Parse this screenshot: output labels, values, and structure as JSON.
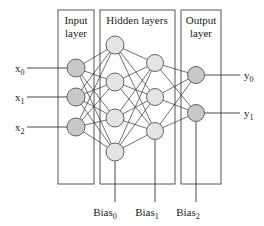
{
  "diagram": {
    "type": "neural-network",
    "colors": {
      "input_node": "#c8c8c8",
      "hidden_node": "#e4e4e4",
      "output_node": "#c8c8c8",
      "stroke": "#555555"
    },
    "layers": {
      "input": {
        "title_line1": "Input",
        "title_line2": "layer",
        "nodes": 3
      },
      "hidden": {
        "title": "Hidden layers",
        "layer1_nodes": 4,
        "layer2_nodes": 3
      },
      "output": {
        "title_line1": "Output",
        "title_line2": "layer",
        "nodes": 2
      }
    },
    "inputs": [
      {
        "base": "x",
        "sub": "0"
      },
      {
        "base": "x",
        "sub": "1"
      },
      {
        "base": "x",
        "sub": "2"
      }
    ],
    "outputs": [
      {
        "base": "y",
        "sub": "0"
      },
      {
        "base": "y",
        "sub": "1"
      }
    ],
    "biases": [
      {
        "base": "Bias",
        "sub": "0"
      },
      {
        "base": "Bias",
        "sub": "1"
      },
      {
        "base": "Bias",
        "sub": "2"
      }
    ]
  }
}
